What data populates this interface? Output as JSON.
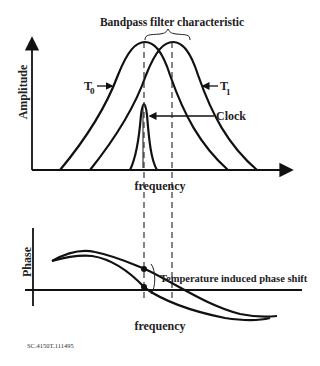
{
  "top_panel": {
    "title": "Bandpass filter characteristic",
    "y_label": "Amplitude",
    "x_label": "frequency",
    "curve_labels": {
      "t0": "T",
      "t0_sub": "0",
      "t1": "T",
      "t1_sub": "1",
      "clock": "Clock"
    }
  },
  "bottom_panel": {
    "y_label": "Phase",
    "x_label": "frequency",
    "annotation": "Temperature induced phase shift"
  },
  "footer": {
    "figure_id": "SC.4150T.111495"
  },
  "colors": {
    "line": "#111111",
    "background": "#ffffff"
  }
}
